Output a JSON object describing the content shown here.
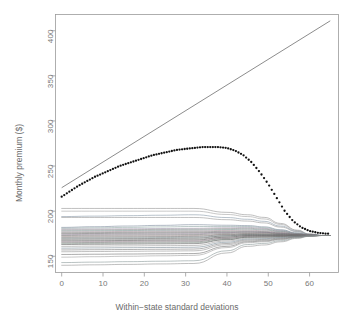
{
  "chart_data": {
    "type": "line",
    "title": "",
    "xlabel": "Within−state standard deviations",
    "ylabel": "Monthly premium ($)",
    "xlim": [
      -1.5,
      67
    ],
    "ylim": [
      132,
      418
    ],
    "xticks": [
      0,
      10,
      20,
      30,
      40,
      50,
      60
    ],
    "xticklabels": [
      "0",
      "10",
      "20",
      "30",
      "40",
      "50",
      "60"
    ],
    "yticks": [
      150,
      200,
      250,
      300,
      350,
      400
    ],
    "yticklabels": [
      "150",
      "200",
      "250",
      "300",
      "350",
      "400"
    ],
    "grid": false,
    "legend": false,
    "frame": "box",
    "series": [
      {
        "name": "reference-line",
        "style": "solid",
        "color": "#5a5a5a",
        "width": 0.7,
        "x": [
          0,
          65
        ],
        "values": [
          226,
          411
        ]
      },
      {
        "name": "average-premium-dotted",
        "style": "dotted",
        "color": "#111111",
        "width": 2.0,
        "x": [
          0,
          2,
          4,
          6,
          8,
          10,
          12,
          14,
          16,
          18,
          20,
          22,
          24,
          26,
          28,
          30,
          32,
          34,
          36,
          38,
          40,
          42,
          44,
          46,
          48,
          50,
          52,
          54,
          56,
          58,
          60,
          62,
          64,
          65
        ],
        "values": [
          216,
          222,
          228,
          233,
          238,
          242,
          246,
          250,
          253,
          256,
          259,
          262,
          264,
          266,
          268,
          269,
          270,
          271,
          271,
          271,
          270,
          267,
          262,
          254,
          243,
          230,
          215,
          200,
          189,
          182,
          178,
          176,
          175,
          175
        ]
      },
      {
        "name": "state-curves-bundle",
        "style": "solid",
        "width": 0.55,
        "x": [
          0,
          5,
          10,
          15,
          20,
          25,
          30,
          35,
          40,
          45,
          50,
          55,
          60,
          65
        ],
        "converge_x": 63,
        "converge_y": 173,
        "curves": [
          {
            "color": "#8a8a8a",
            "start": 203,
            "mid": 203,
            "bend": 196
          },
          {
            "color": "#9a9a9a",
            "start": 200,
            "mid": 200,
            "bend": 194
          },
          {
            "color": "#7d8fa0",
            "start": 194,
            "mid": 196,
            "bend": 191
          },
          {
            "color": "#8e8e8e",
            "start": 193,
            "mid": 193,
            "bend": 189
          },
          {
            "color": "#6f7f92",
            "start": 182,
            "mid": 185,
            "bend": 184
          },
          {
            "color": "#86a09c",
            "start": 181,
            "mid": 183,
            "bend": 183
          },
          {
            "color": "#9a8fa5",
            "start": 180,
            "mid": 181,
            "bend": 182
          },
          {
            "color": "#7f7f7f",
            "start": 179,
            "mid": 180,
            "bend": 181
          },
          {
            "color": "#6e8d8b",
            "start": 178,
            "mid": 179,
            "bend": 180
          },
          {
            "color": "#a38b96",
            "start": 177,
            "mid": 178,
            "bend": 179
          },
          {
            "color": "#707070",
            "start": 176,
            "mid": 177,
            "bend": 178
          },
          {
            "color": "#5f5f5f",
            "start": 175,
            "mid": 176,
            "bend": 177
          },
          {
            "color": "#8d7f92",
            "start": 174,
            "mid": 175,
            "bend": 177
          },
          {
            "color": "#6a6a6a",
            "start": 173,
            "mid": 174,
            "bend": 176
          },
          {
            "color": "#9c8a8a",
            "start": 172,
            "mid": 173,
            "bend": 175
          },
          {
            "color": "#636363",
            "start": 171,
            "mid": 172,
            "bend": 175
          },
          {
            "color": "#7a8b8b",
            "start": 170,
            "mid": 171,
            "bend": 174
          },
          {
            "color": "#555555",
            "start": 169,
            "mid": 170,
            "bend": 174
          },
          {
            "color": "#8c8c8c",
            "start": 168,
            "mid": 169,
            "bend": 173
          },
          {
            "color": "#4f4f4f",
            "start": 167,
            "mid": 168,
            "bend": 173
          },
          {
            "color": "#927f8c",
            "start": 166,
            "mid": 167,
            "bend": 172
          },
          {
            "color": "#6d6d6d",
            "start": 165,
            "mid": 166,
            "bend": 172
          },
          {
            "color": "#7e8f85",
            "start": 164,
            "mid": 165,
            "bend": 171
          },
          {
            "color": "#585858",
            "start": 163,
            "mid": 164,
            "bend": 171
          },
          {
            "color": "#8f8f8f",
            "start": 161,
            "mid": 162,
            "bend": 170
          },
          {
            "color": "#6b7d8a",
            "start": 159,
            "mid": 160,
            "bend": 169
          },
          {
            "color": "#747474",
            "start": 157,
            "mid": 158,
            "bend": 168
          },
          {
            "color": "#8b8b8b",
            "start": 155,
            "mid": 156,
            "bend": 167
          },
          {
            "color": "#666666",
            "start": 152,
            "mid": 153,
            "bend": 166
          },
          {
            "color": "#999999",
            "start": 149,
            "mid": 151,
            "bend": 165
          },
          {
            "color": "#7f8f8f",
            "start": 143,
            "mid": 145,
            "bend": 163
          },
          {
            "color": "#8a8a8a",
            "start": 140,
            "mid": 142,
            "bend": 161
          }
        ]
      }
    ]
  },
  "axes": {
    "x_title": "Within−state standard deviations",
    "y_title": "Monthly premium ($)",
    "x_tick_labels": [
      "0",
      "10",
      "20",
      "30",
      "40",
      "50",
      "60"
    ],
    "y_tick_labels": [
      "150",
      "200",
      "250",
      "300",
      "350",
      "400"
    ]
  },
  "colors": {
    "frame": "#9b9b9b",
    "tick": "#9b9b9b",
    "text": "#787878",
    "background": "#ffffff",
    "dotted_series": "#111111",
    "reference_line": "#5a5a5a"
  }
}
